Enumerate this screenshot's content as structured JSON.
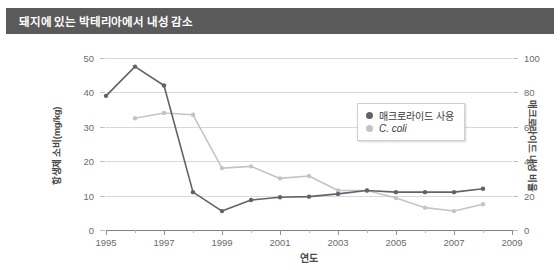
{
  "title": "돼지에 있는 박테리아에서 내성 감소",
  "axes": {
    "x_title": "연도",
    "y_left_title": "항생제 소비(mg/kg)",
    "y_right_title": "매크로라이드 내성 비율",
    "x_ticks": [
      "1995",
      "1997",
      "1999",
      "2001",
      "2003",
      "2005",
      "2007",
      "2009"
    ],
    "y_left_ticks": [
      "0",
      "10",
      "20",
      "30",
      "40",
      "50"
    ],
    "y_right_ticks": [
      "0",
      "20",
      "40",
      "60",
      "80",
      "100"
    ]
  },
  "legend": {
    "items": [
      {
        "label": "매크로라이드 사용",
        "color": "#5f6369",
        "italic": false
      },
      {
        "label": "C. coli",
        "color": "#c2c5c7",
        "italic": true
      }
    ]
  },
  "colors": {
    "title_bar": "#5a5a5a",
    "series_dark": "#5f6369",
    "series_light": "#c2c5c7",
    "gridline": "#d9d9d9",
    "axis": "#808080",
    "tick_text": "#6b6b6b"
  },
  "chart_data": {
    "type": "line",
    "title": "돼지에 있는 박테리아에서 내성 감소",
    "xlabel": "연도",
    "ylabel": "항생제 소비(mg/kg)",
    "y2label": "매크로라이드 내성 비율",
    "xlim": [
      1995,
      2009
    ],
    "ylim": [
      0,
      50
    ],
    "y2lim": [
      0,
      100
    ],
    "grid": true,
    "legend_position": "upper-right",
    "series": [
      {
        "name": "매크로라이드 사용",
        "color": "#5f6369",
        "axis": "left",
        "unit": "mg/kg",
        "x": [
          1995,
          1996,
          1997,
          1998,
          1999,
          2000,
          2001,
          2002,
          2003,
          2004,
          2005,
          2006,
          2007,
          2008
        ],
        "values": [
          39,
          47.5,
          42,
          11,
          5.5,
          8.7,
          9.5,
          9.7,
          10.5,
          11.5,
          11,
          11,
          11,
          12
        ]
      },
      {
        "name": "C. coli",
        "color": "#c2c5c7",
        "axis": "right",
        "unit": "%",
        "x": [
          1996,
          1997,
          1998,
          1999,
          2000,
          2001,
          2002,
          2003,
          2004,
          2005,
          2006,
          2007,
          2008
        ],
        "values_left_scale": [
          32.5,
          34,
          33.5,
          18,
          18.5,
          15,
          15.7,
          11.5,
          11.5,
          9.3,
          6.5,
          5.5,
          7.5
        ],
        "values": [
          65,
          68,
          67,
          36,
          37,
          30,
          31.4,
          23,
          23,
          18.6,
          13,
          11,
          15
        ]
      }
    ]
  }
}
